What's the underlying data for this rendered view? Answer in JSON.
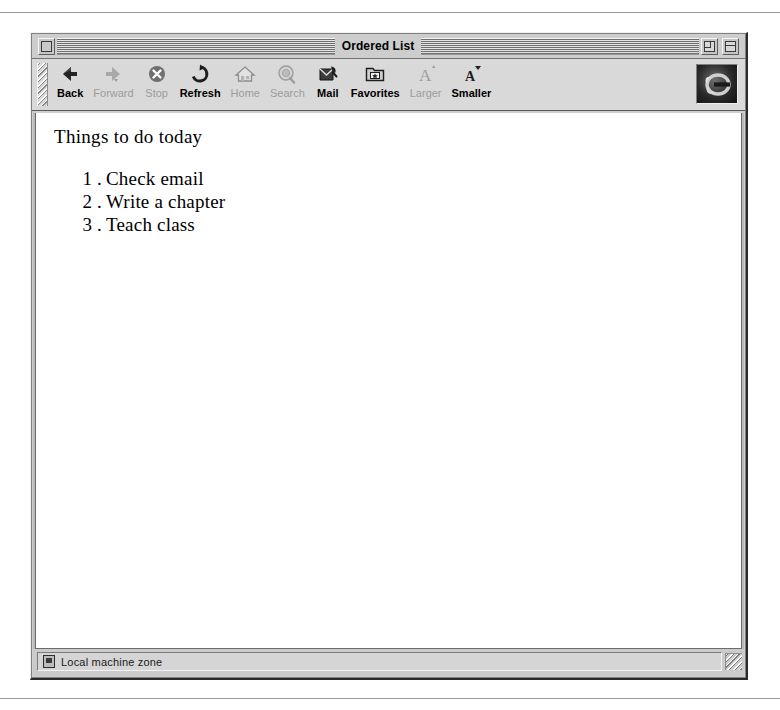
{
  "window": {
    "title": "Ordered List",
    "close_box": "close-box",
    "zoom_box": "zoom-box",
    "collapse_box": "collapse-box"
  },
  "toolbar": {
    "grabber": "toolbar-drag-handle",
    "brand_icon": "internet-explorer-logo",
    "items": [
      {
        "label": "Back",
        "icon": "back-arrow-icon",
        "enabled": true
      },
      {
        "label": "Forward",
        "icon": "forward-arrow-icon",
        "enabled": false
      },
      {
        "label": "Stop",
        "icon": "stop-x-circle-icon",
        "enabled": false
      },
      {
        "label": "Refresh",
        "icon": "refresh-circle-icon",
        "enabled": true
      },
      {
        "label": "Home",
        "icon": "home-house-icon",
        "enabled": false
      },
      {
        "label": "Search",
        "icon": "search-magnifier-icon",
        "enabled": false
      },
      {
        "label": "Mail",
        "icon": "mail-envelope-icon",
        "enabled": true
      },
      {
        "label": "Favorites",
        "icon": "favorites-folder-star-icon",
        "enabled": true
      },
      {
        "label": "Larger",
        "icon": "text-larger-a-icon",
        "enabled": false
      },
      {
        "label": "Smaller",
        "icon": "text-smaller-a-icon",
        "enabled": true
      }
    ]
  },
  "page": {
    "heading": "Things to do today",
    "list": [
      {
        "marker": "1 .",
        "text": "Check email"
      },
      {
        "marker": "2 .",
        "text": "Write a chapter"
      },
      {
        "marker": "3 .",
        "text": "Teach class"
      }
    ]
  },
  "statusbar": {
    "zone_icon": "local-machine-zone-icon",
    "zone_text": "Local machine zone",
    "resize_grip": "resize-grip"
  },
  "colors": {
    "chrome": "#cdcdcd",
    "toolbar": "#d9d9d9",
    "content": "#ffffff",
    "disabled_label": "#9c9c9c",
    "frame_dark": "#2b2b2b"
  }
}
